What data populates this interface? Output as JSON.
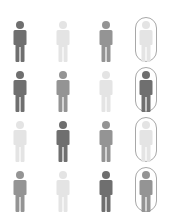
{
  "colors": {
    "dark": "#6f6f6f",
    "medium": "#949494",
    "light": "#e4e4e4",
    "outline": "#a8a8a8",
    "background": "#ffffff"
  },
  "grid": {
    "rows": 4,
    "columns": 4,
    "highlighted_column": 4,
    "cells": [
      [
        {
          "shade": "dark"
        },
        {
          "shade": "light"
        },
        {
          "shade": "medium"
        },
        {
          "shade": "light",
          "boxed": true
        }
      ],
      [
        {
          "shade": "dark"
        },
        {
          "shade": "medium"
        },
        {
          "shade": "light"
        },
        {
          "shade": "dark",
          "boxed": true
        }
      ],
      [
        {
          "shade": "light"
        },
        {
          "shade": "dark"
        },
        {
          "shade": "medium"
        },
        {
          "shade": "light",
          "boxed": true
        }
      ],
      [
        {
          "shade": "medium"
        },
        {
          "shade": "light"
        },
        {
          "shade": "dark"
        },
        {
          "shade": "medium",
          "boxed": true
        }
      ]
    ]
  },
  "icon": "person-icon"
}
